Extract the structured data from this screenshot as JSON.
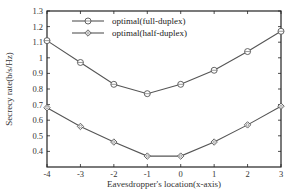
{
  "chart_data": {
    "type": "line",
    "title": "",
    "xlabel": "Eavesdropper's location(x-axis)",
    "ylabel": "Secrecy rate(b/s/Hz)",
    "x": [
      -4,
      -3,
      -2,
      -1,
      0,
      1,
      2,
      3
    ],
    "xlim": [
      -4,
      3
    ],
    "ylim": [
      0.3,
      1.3
    ],
    "xticks": [
      "-4",
      "-3",
      "-2",
      "-1",
      "0",
      "1",
      "2",
      "3"
    ],
    "yticks": [
      "1.3",
      "1.2",
      "1.1",
      "1",
      "0.9",
      "0.8",
      "0.7",
      "0.6",
      "0.5",
      "0.4"
    ],
    "grid": false,
    "legend_position": "upper center",
    "series": [
      {
        "name": "optimal(full-duplex)",
        "marker": "circle",
        "values": [
          1.11,
          0.97,
          0.83,
          0.77,
          0.83,
          0.92,
          1.04,
          1.17
        ]
      },
      {
        "name": "optimal(half-duplex)",
        "marker": "diamond",
        "values": [
          0.68,
          0.56,
          0.46,
          0.37,
          0.37,
          0.46,
          0.57,
          0.69
        ]
      }
    ],
    "colors": {
      "line": "#555555",
      "axis": "#222222"
    }
  }
}
